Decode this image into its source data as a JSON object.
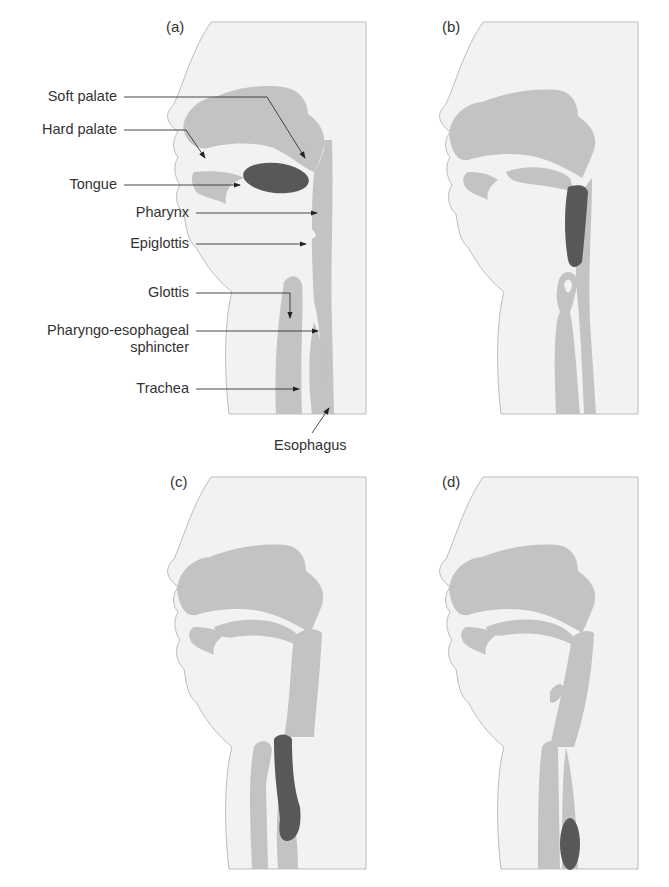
{
  "figure": {
    "colors": {
      "background": "#ffffff",
      "skin": "#f2f2f2",
      "outline": "#bdbdbd",
      "tissue": "#c3c3c3",
      "bolus": "#585858",
      "text": "#333333"
    },
    "panels": [
      {
        "id": "a",
        "label": "(a)",
        "bolus_position": "oral cavity (on tongue)"
      },
      {
        "id": "b",
        "label": "(b)",
        "bolus_position": "oropharynx"
      },
      {
        "id": "c",
        "label": "(c)",
        "bolus_position": "pharyngo-esophageal sphincter"
      },
      {
        "id": "d",
        "label": "(d)",
        "bolus_position": "esophagus"
      }
    ],
    "annotations": [
      {
        "text": "Soft palate"
      },
      {
        "text": "Hard palate"
      },
      {
        "text": "Tongue"
      },
      {
        "text": "Pharynx"
      },
      {
        "text": "Epiglottis"
      },
      {
        "text": "Glottis"
      },
      {
        "text": "Pharyngo-esophageal",
        "text2": "sphincter"
      },
      {
        "text": "Trachea"
      },
      {
        "text": "Esophagus"
      }
    ]
  }
}
